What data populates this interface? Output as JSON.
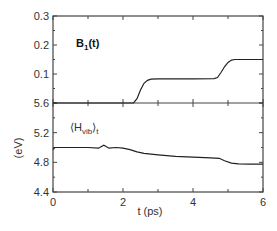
{
  "chart_data": [
    {
      "type": "line",
      "panel": "top",
      "title": "B1(t)",
      "label_main": "B",
      "label_sub": "1",
      "label_tail": "(t)",
      "xlabel": "t (ps)",
      "ylabel": "",
      "xlim": [
        0,
        6
      ],
      "ylim": [
        0.0,
        0.3
      ],
      "yticks": [
        0.0,
        0.1,
        0.2,
        0.3
      ],
      "ytick_labels": [
        "5.6",
        "0.1",
        "0.2",
        "0.3"
      ],
      "series": [
        {
          "name": "B1(t)",
          "x": [
            0,
            1,
            2,
            2.3,
            2.4,
            2.5,
            2.6,
            2.7,
            2.8,
            3.0,
            4.0,
            4.6,
            4.7,
            4.8,
            4.9,
            5.0,
            5.1,
            5.2,
            5.4,
            6.0
          ],
          "y": [
            0,
            0,
            0,
            0.0,
            0.015,
            0.045,
            0.068,
            0.078,
            0.082,
            0.083,
            0.083,
            0.084,
            0.088,
            0.105,
            0.125,
            0.14,
            0.148,
            0.15,
            0.15,
            0.15
          ]
        }
      ]
    },
    {
      "type": "line",
      "panel": "bottom",
      "title": "<H_vib>_t",
      "label_main": "H",
      "label_sub": "vib",
      "label_tail": "t",
      "xlabel": "t (ps)",
      "ylabel": "(eV)",
      "xlim": [
        0,
        6
      ],
      "ylim": [
        4.4,
        5.6
      ],
      "yticks": [
        4.4,
        4.8,
        5.2,
        5.6
      ],
      "ytick_labels": [
        "4.4",
        "4.8",
        "5.2",
        "5.6"
      ],
      "xticks": [
        0,
        2,
        4,
        6
      ],
      "xtick_labels": [
        "0",
        "2",
        "4",
        "6"
      ],
      "series": [
        {
          "name": "<H_vib>_t",
          "x": [
            0,
            0.05,
            0.5,
            1.0,
            1.3,
            1.45,
            1.6,
            1.8,
            2.0,
            2.2,
            2.4,
            2.6,
            3.0,
            3.5,
            4.0,
            4.5,
            4.75,
            4.9,
            5.1,
            5.3,
            5.6,
            6.0
          ],
          "y": [
            4.97,
            5.0,
            5.0,
            5.0,
            4.99,
            5.03,
            4.99,
            5.0,
            4.99,
            4.97,
            4.94,
            4.92,
            4.9,
            4.88,
            4.87,
            4.86,
            4.855,
            4.82,
            4.79,
            4.78,
            4.775,
            4.775
          ]
        }
      ]
    }
  ],
  "axes": {
    "x_label": "t (ps)",
    "y_label": "(eV)",
    "x_tick_labels": [
      "0",
      "2",
      "4",
      "6"
    ],
    "top_y_tick_labels": [
      "0.3",
      "0.2",
      "0.1",
      "5.6"
    ],
    "bottom_y_tick_labels": [
      "5.2",
      "4.8",
      "4.4"
    ]
  },
  "colors": {
    "line": "#222222",
    "axis": "#444444"
  }
}
